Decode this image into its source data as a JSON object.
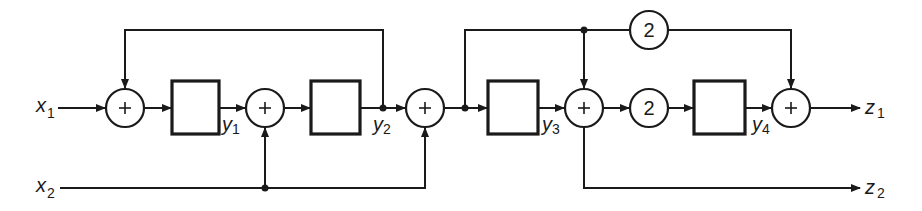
{
  "diagram": {
    "inputs": [
      {
        "var": "x",
        "sub": "1"
      },
      {
        "var": "x",
        "sub": "2"
      }
    ],
    "outputs": [
      {
        "var": "z",
        "sub": "1"
      },
      {
        "var": "z",
        "sub": "2"
      }
    ],
    "states": [
      {
        "var": "y",
        "sub": "1"
      },
      {
        "var": "y",
        "sub": "2"
      },
      {
        "var": "y",
        "sub": "3"
      },
      {
        "var": "y",
        "sub": "4"
      }
    ],
    "gains": [
      {
        "value": "2"
      },
      {
        "value": "2"
      }
    ],
    "adder_symbol": "+"
  }
}
